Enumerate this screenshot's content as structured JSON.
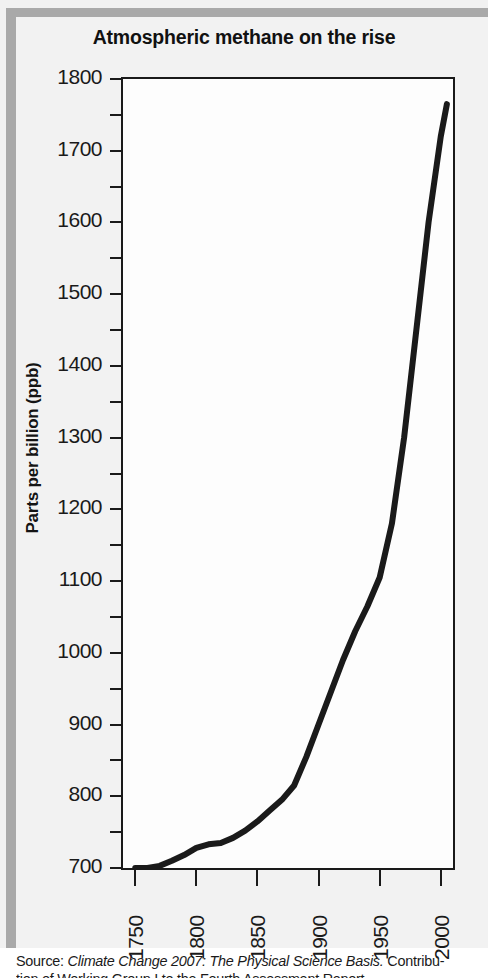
{
  "figure": {
    "title": "Atmospheric methane on the rise",
    "source_lead": "Source: ",
    "source_italic": "Climate Change 2007: The Physical Science Basis.",
    "source_tail": " Contribu-",
    "source_line2": "tion of Working Group I to the Fourth Assessment Report"
  },
  "chart_data": {
    "type": "line",
    "title": "Atmospheric methane on the rise",
    "xlabel": "",
    "ylabel": "Parts per billion (ppb)",
    "xlim": [
      1740,
      2010
    ],
    "ylim": [
      700,
      1800
    ],
    "grid": false,
    "legend": "none",
    "line_color": "#1a1a1a",
    "background_color": "#fdfdfd",
    "panel_color": "#f2f2f2",
    "x_ticks": [
      1750,
      1800,
      1850,
      1900,
      1950,
      2000
    ],
    "y_ticks": [
      700,
      800,
      900,
      1000,
      1100,
      1200,
      1300,
      1400,
      1500,
      1600,
      1700,
      1800
    ],
    "y_minor_ticks": [
      750,
      850,
      950,
      1050,
      1150,
      1250,
      1350,
      1450,
      1550,
      1650,
      1750
    ],
    "series": [
      {
        "name": "Atmospheric methane",
        "x": [
          1750,
          1760,
          1770,
          1780,
          1790,
          1800,
          1810,
          1820,
          1830,
          1840,
          1850,
          1860,
          1870,
          1880,
          1890,
          1900,
          1910,
          1920,
          1930,
          1940,
          1950,
          1960,
          1970,
          1980,
          1990,
          2000,
          2005
        ],
        "values": [
          700,
          700,
          703,
          710,
          718,
          728,
          733,
          735,
          742,
          752,
          765,
          780,
          795,
          815,
          855,
          900,
          945,
          990,
          1030,
          1065,
          1105,
          1180,
          1300,
          1450,
          1600,
          1720,
          1765
        ]
      }
    ]
  },
  "y_axis": {
    "labels": [
      "1800",
      "1700",
      "1600",
      "1500",
      "1400",
      "1300",
      "1200",
      "1100",
      "1000",
      "900",
      "800",
      "700"
    ],
    "title": "Parts per billion (ppb)"
  },
  "x_axis": {
    "labels": [
      "1750",
      "1800",
      "1850",
      "1900",
      "1950",
      "2000"
    ]
  }
}
